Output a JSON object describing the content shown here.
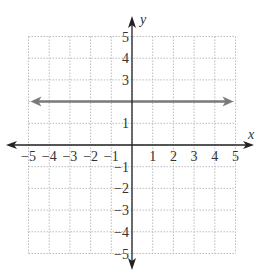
{
  "chart_data": {
    "type": "line",
    "title": "",
    "xlabel": "x",
    "ylabel": "y",
    "xlim": [
      -5,
      5
    ],
    "ylim": [
      -5,
      5
    ],
    "grid": true,
    "x_ticks": [
      "-5",
      "-4",
      "-3",
      "-2",
      "-1",
      "1",
      "2",
      "3",
      "4",
      "5"
    ],
    "y_ticks": [
      "5",
      "4",
      "3",
      "1",
      "-1",
      "-2",
      "-3",
      "-4",
      "-5"
    ],
    "series": [
      {
        "name": "y = 2",
        "x": [
          -5,
          5
        ],
        "y": [
          2,
          2
        ],
        "color": "#7a7a7a",
        "arrows": "both"
      }
    ]
  },
  "colors": {
    "axis": "#222222",
    "grid": "#bbbbbb",
    "line": "#7a7a7a"
  }
}
